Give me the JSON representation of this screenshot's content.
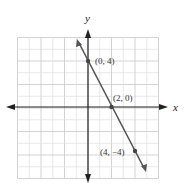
{
  "chart_data": {
    "type": "line",
    "title": "",
    "xlabel": "x",
    "ylabel": "y",
    "xlim": [
      -6,
      6
    ],
    "ylim": [
      -6,
      6
    ],
    "grid": true,
    "series": [
      {
        "name": "y = -2x + 4",
        "x": [
          -1.5,
          5.5
        ],
        "y": [
          7,
          -7
        ]
      }
    ],
    "points": [
      {
        "x": 0,
        "y": 4,
        "label": "(0, 4)"
      },
      {
        "x": 2,
        "y": 0,
        "label": "(2, 0)"
      },
      {
        "x": 4,
        "y": -4,
        "label": "(4, −4)"
      }
    ]
  },
  "axes": {
    "x_label": "x",
    "y_label": "y"
  },
  "labels": {
    "p1": "(0, 4)",
    "p2": "(2, 0)",
    "p3": "(4, −4)"
  }
}
